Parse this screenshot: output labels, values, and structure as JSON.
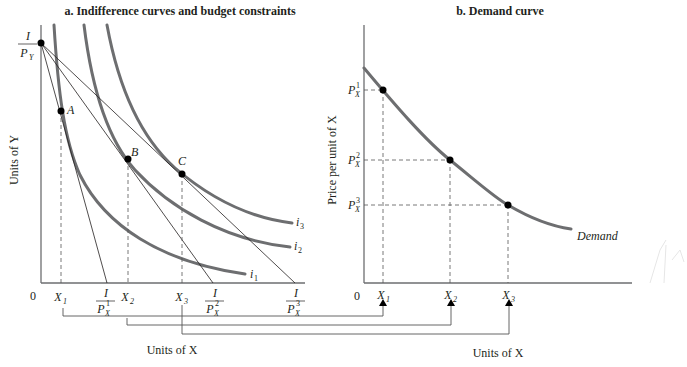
{
  "panel_a": {
    "title": "a. Indifference curves and budget constraints",
    "y_axis_label": "Units of Y",
    "x_axis_label": "Units of X",
    "origin": "0",
    "y_intercept": {
      "num": "I",
      "den": "P",
      "den_sub": "Y"
    },
    "points": [
      {
        "label": "A"
      },
      {
        "label": "B"
      },
      {
        "label": "C"
      }
    ],
    "curves": [
      {
        "label": "i",
        "sub": "1"
      },
      {
        "label": "i",
        "sub": "2"
      },
      {
        "label": "i",
        "sub": "3"
      }
    ],
    "x_ticks": [
      {
        "label": "X",
        "sub": "1"
      },
      {
        "label": "X",
        "sub": "2"
      },
      {
        "label": "X",
        "sub": "3"
      }
    ],
    "intercepts": [
      {
        "num": "I",
        "den": "P",
        "den_sup": "1",
        "den_sub": "X"
      },
      {
        "num": "I",
        "den": "P",
        "den_sup": "2",
        "den_sub": "X"
      },
      {
        "num": "I",
        "den": "P",
        "den_sup": "3",
        "den_sub": "X"
      }
    ]
  },
  "panel_b": {
    "title": "b. Demand curve",
    "y_axis_label": "Price per unit of X",
    "x_axis_label": "Units of X",
    "origin": "0",
    "curve_label": "Demand",
    "price_ticks": [
      {
        "label": "P",
        "sup": "1",
        "sub": "X"
      },
      {
        "label": "P",
        "sup": "2",
        "sub": "X"
      },
      {
        "label": "P",
        "sup": "3",
        "sub": "X"
      }
    ],
    "x_ticks": [
      {
        "label": "X",
        "sub": "1"
      },
      {
        "label": "X",
        "sub": "2"
      },
      {
        "label": "X",
        "sub": "3"
      }
    ]
  },
  "colors": {
    "curve": "#6d6e70",
    "line": "#231f20",
    "point": "#000000"
  }
}
